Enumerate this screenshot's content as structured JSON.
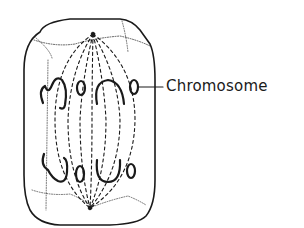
{
  "diagram": {
    "labels": [
      {
        "text": "Chromosome",
        "points_to": "chromosome"
      }
    ]
  },
  "colors": {
    "ink": "#1a1a1a",
    "background": "#ffffff"
  }
}
